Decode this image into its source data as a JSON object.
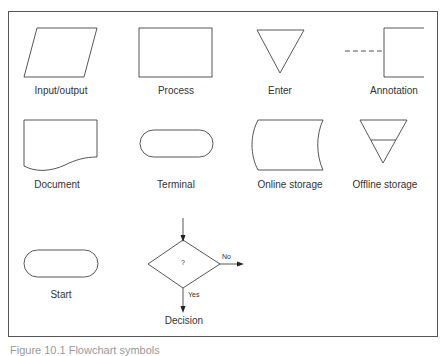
{
  "symbols": [
    {
      "id": "input-output",
      "label": "Input/output"
    },
    {
      "id": "process",
      "label": "Process"
    },
    {
      "id": "enter",
      "label": "Enter"
    },
    {
      "id": "annotation",
      "label": "Annotation"
    },
    {
      "id": "document",
      "label": "Document"
    },
    {
      "id": "terminal",
      "label": "Terminal"
    },
    {
      "id": "online-storage",
      "label": "Online storage"
    },
    {
      "id": "offline-storage",
      "label": "Offline storage"
    },
    {
      "id": "start",
      "label": "Start"
    },
    {
      "id": "decision",
      "label": "Decision"
    }
  ],
  "decision": {
    "question": "?",
    "no_label": "No",
    "yes_label": "Yes"
  },
  "caption": "Figure 10.1  Flowchart symbols",
  "colors": {
    "stroke": "#444444",
    "border": "#555555",
    "background": "#ffffff"
  }
}
